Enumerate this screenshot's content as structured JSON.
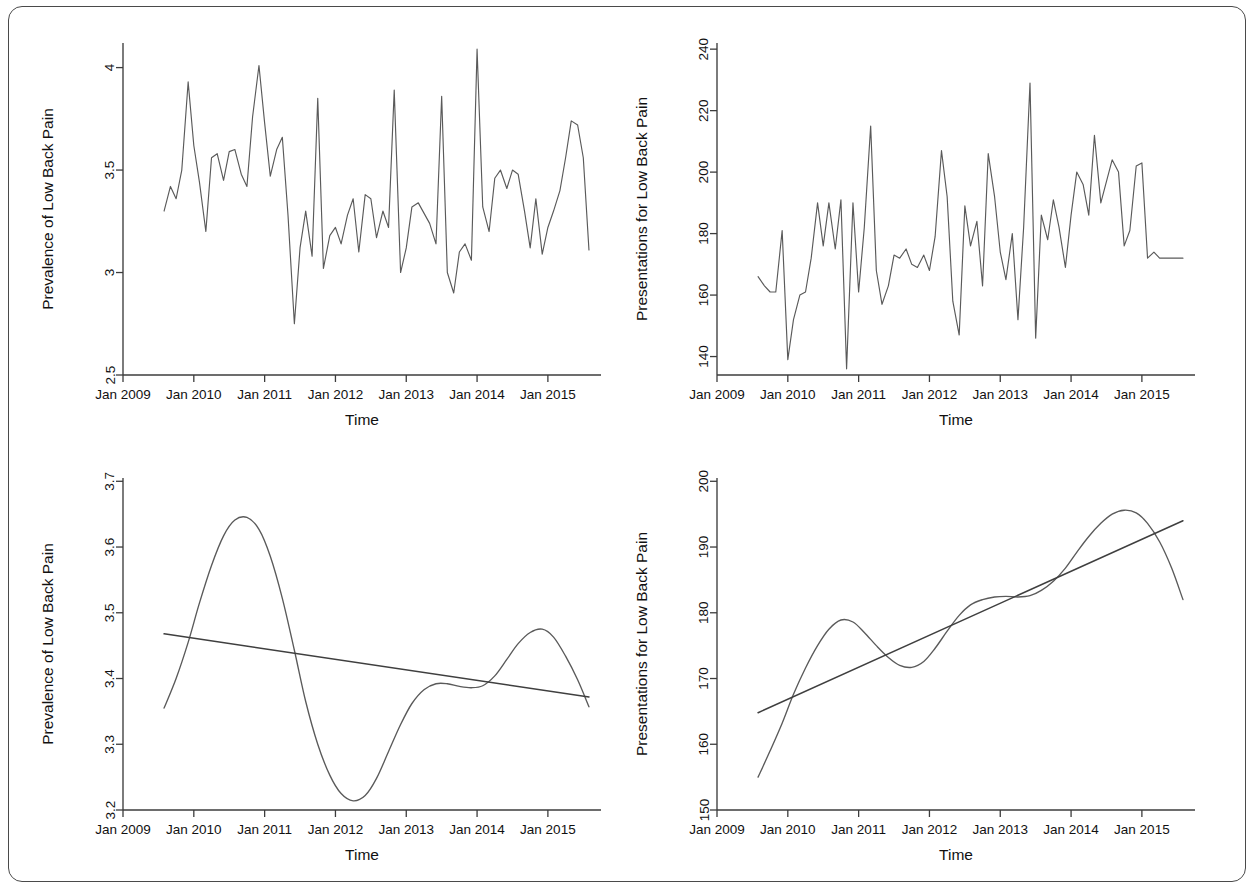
{
  "figure": {
    "panel_count": 4,
    "frame_border_color": "#4a4a4a",
    "line_color": "#5a5a5a"
  },
  "axis": {
    "x_title": "Time",
    "x_tick_labels": [
      "Jan 2009",
      "Jan 2010",
      "Jan 2011",
      "Jan 2012",
      "Jan 2013",
      "Jan 2014",
      "Jan 2015"
    ],
    "x_tick_years": [
      2009,
      2010,
      2011,
      2012,
      2013,
      2014,
      2015
    ],
    "y_title_prevalence": "Prevalence of Low Back Pain",
    "y_title_presentations": "Presentations for Low Back Pain"
  },
  "chart_data": [
    {
      "id": "panel-top-left",
      "type": "line",
      "title": "",
      "xlabel": "Time",
      "ylabel": "Prevalence of Low Back Pain",
      "xlim": [
        2009.0,
        2015.75
      ],
      "ylim": [
        2.5,
        4.12
      ],
      "yticks": [
        2.5,
        3,
        3.5,
        4
      ],
      "ytick_labels": [
        "2.5",
        "3",
        "3.5",
        "4"
      ],
      "xticks": [
        2009,
        2010,
        2011,
        2012,
        2013,
        2014,
        2015
      ],
      "xtick_labels": [
        "Jan 2009",
        "Jan 2010",
        "Jan 2011",
        "Jan 2012",
        "Jan 2013",
        "Jan 2014",
        "Jan 2015"
      ],
      "grid": false,
      "legend": "none",
      "x": [
        2009.58,
        2009.67,
        2009.75,
        2009.83,
        2009.92,
        2010.0,
        2010.08,
        2010.17,
        2010.25,
        2010.33,
        2010.42,
        2010.5,
        2010.58,
        2010.67,
        2010.75,
        2010.83,
        2010.92,
        2011.0,
        2011.08,
        2011.17,
        2011.25,
        2011.33,
        2011.42,
        2011.5,
        2011.58,
        2011.67,
        2011.75,
        2011.83,
        2011.92,
        2012.0,
        2012.08,
        2012.17,
        2012.25,
        2012.33,
        2012.42,
        2012.5,
        2012.58,
        2012.67,
        2012.75,
        2012.83,
        2012.92,
        2013.0,
        2013.08,
        2013.17,
        2013.25,
        2013.33,
        2013.42,
        2013.5,
        2013.58,
        2013.67,
        2013.75,
        2013.83,
        2013.92,
        2014.0,
        2014.08,
        2014.17,
        2014.25,
        2014.33,
        2014.42,
        2014.5,
        2014.58,
        2014.67,
        2014.75,
        2014.83,
        2014.92,
        2015.0,
        2015.08,
        2015.17,
        2015.25,
        2015.33,
        2015.42,
        2015.5,
        2015.58
      ],
      "y": [
        3.3,
        3.42,
        3.36,
        3.5,
        3.93,
        3.62,
        3.44,
        3.2,
        3.56,
        3.58,
        3.45,
        3.59,
        3.6,
        3.48,
        3.42,
        3.76,
        4.01,
        3.73,
        3.47,
        3.6,
        3.66,
        3.28,
        2.75,
        3.12,
        3.3,
        3.08,
        3.85,
        3.02,
        3.18,
        3.22,
        3.14,
        3.28,
        3.36,
        3.1,
        3.38,
        3.36,
        3.17,
        3.3,
        3.22,
        3.89,
        3.0,
        3.12,
        3.32,
        3.34,
        3.29,
        3.24,
        3.14,
        3.86,
        3.0,
        2.9,
        3.1,
        3.14,
        3.06,
        4.09,
        3.32,
        3.2,
        3.46,
        3.5,
        3.41,
        3.5,
        3.48,
        3.3,
        3.12,
        3.36,
        3.09,
        3.22,
        3.3,
        3.4,
        3.56,
        3.74,
        3.72,
        3.56,
        3.11
      ]
    },
    {
      "id": "panel-top-right",
      "type": "line",
      "title": "",
      "xlabel": "Time",
      "ylabel": "Presentations for Low Back Pain",
      "xlim": [
        2009.0,
        2015.75
      ],
      "ylim": [
        134,
        242
      ],
      "yticks": [
        140,
        160,
        180,
        200,
        220,
        240
      ],
      "ytick_labels": [
        "140",
        "160",
        "180",
        "200",
        "220",
        "240"
      ],
      "xticks": [
        2009,
        2010,
        2011,
        2012,
        2013,
        2014,
        2015
      ],
      "xtick_labels": [
        "Jan 2009",
        "Jan 2010",
        "Jan 2011",
        "Jan 2012",
        "Jan 2013",
        "Jan 2014",
        "Jan 2015"
      ],
      "grid": false,
      "legend": "none",
      "x": [
        2009.58,
        2009.67,
        2009.75,
        2009.83,
        2009.92,
        2010.0,
        2010.08,
        2010.17,
        2010.25,
        2010.33,
        2010.42,
        2010.5,
        2010.58,
        2010.67,
        2010.75,
        2010.83,
        2010.92,
        2011.0,
        2011.08,
        2011.17,
        2011.25,
        2011.33,
        2011.42,
        2011.5,
        2011.58,
        2011.67,
        2011.75,
        2011.83,
        2011.92,
        2012.0,
        2012.08,
        2012.17,
        2012.25,
        2012.33,
        2012.42,
        2012.5,
        2012.58,
        2012.67,
        2012.75,
        2012.83,
        2012.92,
        2013.0,
        2013.08,
        2013.17,
        2013.25,
        2013.33,
        2013.42,
        2013.5,
        2013.58,
        2013.67,
        2013.75,
        2013.83,
        2013.92,
        2014.0,
        2014.08,
        2014.17,
        2014.25,
        2014.33,
        2014.42,
        2014.5,
        2014.58,
        2014.67,
        2014.75,
        2014.83,
        2014.92,
        2015.0,
        2015.08,
        2015.17,
        2015.25,
        2015.33,
        2015.42,
        2015.5,
        2015.58
      ],
      "y": [
        166,
        163,
        161,
        161,
        181,
        139,
        152,
        160,
        161,
        172,
        190,
        176,
        190,
        175,
        191,
        136,
        190,
        161,
        182,
        215,
        168,
        157,
        163,
        173,
        172,
        175,
        170,
        169,
        173,
        168,
        179,
        207,
        192,
        158,
        147,
        189,
        176,
        184,
        163,
        206,
        192,
        174,
        165,
        180,
        152,
        182,
        229,
        146,
        186,
        178,
        191,
        182,
        169,
        186,
        200,
        196,
        186,
        212,
        190,
        197,
        204,
        200,
        176,
        181,
        202,
        203,
        172,
        174,
        172,
        172,
        172,
        172,
        172
      ]
    },
    {
      "id": "panel-bottom-left",
      "type": "line",
      "title": "",
      "xlabel": "Time",
      "ylabel": "Prevalence of Low Back Pain",
      "xlim": [
        2009.0,
        2015.75
      ],
      "ylim": [
        3.2,
        3.705
      ],
      "yticks": [
        3.2,
        3.3,
        3.4,
        3.5,
        3.6,
        3.7
      ],
      "ytick_labels": [
        "3.2",
        "3.3",
        "3.4",
        "3.5",
        "3.6",
        "3.7"
      ],
      "xticks": [
        2009,
        2010,
        2011,
        2012,
        2013,
        2014,
        2015
      ],
      "xtick_labels": [
        "Jan 2009",
        "Jan 2010",
        "Jan 2011",
        "Jan 2012",
        "Jan 2013",
        "Jan 2014",
        "Jan 2015"
      ],
      "grid": false,
      "legend": "none",
      "series": [
        {
          "name": "smoothed trend",
          "x": [
            2009.58,
            2009.75,
            2009.92,
            2010.08,
            2010.25,
            2010.42,
            2010.58,
            2010.75,
            2010.92,
            2011.08,
            2011.25,
            2011.42,
            2011.58,
            2011.75,
            2011.92,
            2012.08,
            2012.25,
            2012.42,
            2012.58,
            2012.75,
            2012.92,
            2013.08,
            2013.25,
            2013.42,
            2013.58,
            2013.75,
            2013.92,
            2014.08,
            2014.25,
            2014.42,
            2014.58,
            2014.75,
            2014.92,
            2015.08,
            2015.25,
            2015.42,
            2015.58
          ],
          "y": [
            3.355,
            3.4,
            3.455,
            3.515,
            3.572,
            3.617,
            3.641,
            3.645,
            3.627,
            3.586,
            3.522,
            3.443,
            3.365,
            3.3,
            3.253,
            3.225,
            3.214,
            3.222,
            3.248,
            3.289,
            3.33,
            3.362,
            3.383,
            3.392,
            3.392,
            3.388,
            3.386,
            3.389,
            3.404,
            3.429,
            3.453,
            3.47,
            3.475,
            3.463,
            3.434,
            3.398,
            3.357
          ]
        },
        {
          "name": "linear trend",
          "x": [
            2009.58,
            2015.58
          ],
          "y": [
            3.468,
            3.372
          ]
        }
      ]
    },
    {
      "id": "panel-bottom-right",
      "type": "line",
      "title": "",
      "xlabel": "Time",
      "ylabel": "Presentations for Low Back Pain",
      "xlim": [
        2009.0,
        2015.75
      ],
      "ylim": [
        150,
        200.5
      ],
      "yticks": [
        150,
        160,
        170,
        180,
        190,
        200
      ],
      "ytick_labels": [
        "150",
        "160",
        "170",
        "180",
        "190",
        "200"
      ],
      "xticks": [
        2009,
        2010,
        2011,
        2012,
        2013,
        2014,
        2015
      ],
      "xtick_labels": [
        "Jan 2009",
        "Jan 2010",
        "Jan 2011",
        "Jan 2012",
        "Jan 2013",
        "Jan 2014",
        "Jan 2015"
      ],
      "grid": false,
      "legend": "none",
      "series": [
        {
          "name": "smoothed trend",
          "x": [
            2009.58,
            2009.75,
            2009.92,
            2010.08,
            2010.25,
            2010.42,
            2010.58,
            2010.75,
            2010.92,
            2011.08,
            2011.25,
            2011.42,
            2011.58,
            2011.75,
            2011.92,
            2012.08,
            2012.25,
            2012.42,
            2012.58,
            2012.75,
            2012.92,
            2013.08,
            2013.25,
            2013.42,
            2013.58,
            2013.75,
            2013.92,
            2014.08,
            2014.25,
            2014.42,
            2014.58,
            2014.75,
            2014.92,
            2015.08,
            2015.25,
            2015.42,
            2015.58
          ],
          "y": [
            155.0,
            159.0,
            163.2,
            167.6,
            171.6,
            175.0,
            177.5,
            178.9,
            178.6,
            177.0,
            175.0,
            173.2,
            172.0,
            171.7,
            172.6,
            174.6,
            177.2,
            179.6,
            181.2,
            182.0,
            182.4,
            182.5,
            182.4,
            182.6,
            183.4,
            184.8,
            186.8,
            189.2,
            191.6,
            193.6,
            195.0,
            195.6,
            195.2,
            193.6,
            190.8,
            186.8,
            182.0
          ]
        },
        {
          "name": "linear trend",
          "x": [
            2009.58,
            2015.58
          ],
          "y": [
            164.8,
            194.0
          ]
        }
      ]
    }
  ]
}
